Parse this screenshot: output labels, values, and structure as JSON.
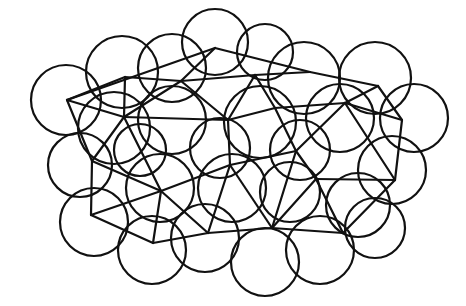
{
  "diagram": {
    "width": 466,
    "height": 306,
    "stroke_color": "#111111",
    "background": "#ffffff",
    "circles": [
      [
        66,
        100,
        35
      ],
      [
        122,
        72,
        36
      ],
      [
        172,
        68,
        34
      ],
      [
        215,
        42,
        33
      ],
      [
        265,
        52,
        28
      ],
      [
        304,
        78,
        36
      ],
      [
        375,
        78,
        36
      ],
      [
        414,
        118,
        34
      ],
      [
        114,
        128,
        36
      ],
      [
        172,
        120,
        34
      ],
      [
        260,
        122,
        36
      ],
      [
        340,
        118,
        34
      ],
      [
        80,
        165,
        32
      ],
      [
        140,
        150,
        26
      ],
      [
        220,
        148,
        30
      ],
      [
        300,
        150,
        30
      ],
      [
        392,
        170,
        34
      ],
      [
        94,
        222,
        34
      ],
      [
        160,
        188,
        34
      ],
      [
        232,
        188,
        34
      ],
      [
        290,
        192,
        30
      ],
      [
        358,
        205,
        32
      ],
      [
        152,
        250,
        34
      ],
      [
        205,
        238,
        34
      ],
      [
        265,
        262,
        34
      ],
      [
        320,
        250,
        34
      ],
      [
        375,
        228,
        30
      ]
    ],
    "vertices": {
      "A": [
        67,
        100
      ],
      "B": [
        125,
        77
      ],
      "C": [
        215,
        48
      ],
      "D": [
        310,
        72
      ],
      "E": [
        378,
        86
      ],
      "F": [
        402,
        120
      ],
      "G": [
        124,
        117
      ],
      "H": [
        181,
        81
      ],
      "I": [
        255,
        75
      ],
      "J": [
        345,
        103
      ],
      "K": [
        296,
        151
      ],
      "L": [
        228,
        120
      ],
      "M": [
        161,
        191
      ],
      "N": [
        92,
        161
      ],
      "O": [
        91,
        215
      ],
      "P": [
        153,
        243
      ],
      "Q": [
        208,
        233
      ],
      "R": [
        272,
        228
      ],
      "S": [
        343,
        233
      ],
      "T": [
        395,
        180
      ],
      "U": [
        230,
        165
      ],
      "V": [
        316,
        179
      ],
      "W": [
        275,
        108
      ]
    },
    "edges": [
      [
        "A",
        "C"
      ],
      [
        "C",
        "D"
      ],
      [
        "D",
        "E"
      ],
      [
        "E",
        "F"
      ],
      [
        "F",
        "T"
      ],
      [
        "T",
        "S"
      ],
      [
        "S",
        "R"
      ],
      [
        "R",
        "Q"
      ],
      [
        "Q",
        "P"
      ],
      [
        "P",
        "O"
      ],
      [
        "O",
        "N"
      ],
      [
        "N",
        "A"
      ],
      [
        "A",
        "G"
      ],
      [
        "B",
        "G"
      ],
      [
        "G",
        "H"
      ],
      [
        "H",
        "C"
      ],
      [
        "H",
        "I"
      ],
      [
        "I",
        "D"
      ],
      [
        "I",
        "W"
      ],
      [
        "W",
        "J"
      ],
      [
        "J",
        "E"
      ],
      [
        "J",
        "F"
      ],
      [
        "G",
        "L"
      ],
      [
        "H",
        "L"
      ],
      [
        "L",
        "I"
      ],
      [
        "L",
        "W"
      ],
      [
        "W",
        "K"
      ],
      [
        "K",
        "J"
      ],
      [
        "J",
        "T"
      ],
      [
        "G",
        "N"
      ],
      [
        "G",
        "M"
      ],
      [
        "L",
        "U"
      ],
      [
        "U",
        "K"
      ],
      [
        "U",
        "M"
      ],
      [
        "M",
        "N"
      ],
      [
        "M",
        "O"
      ],
      [
        "M",
        "P"
      ],
      [
        "M",
        "Q"
      ],
      [
        "U",
        "Q"
      ],
      [
        "U",
        "R"
      ],
      [
        "K",
        "V"
      ],
      [
        "V",
        "R"
      ],
      [
        "V",
        "S"
      ],
      [
        "V",
        "T"
      ],
      [
        "K",
        "R"
      ],
      [
        "B",
        "H"
      ],
      [
        "B",
        "A"
      ]
    ]
  }
}
